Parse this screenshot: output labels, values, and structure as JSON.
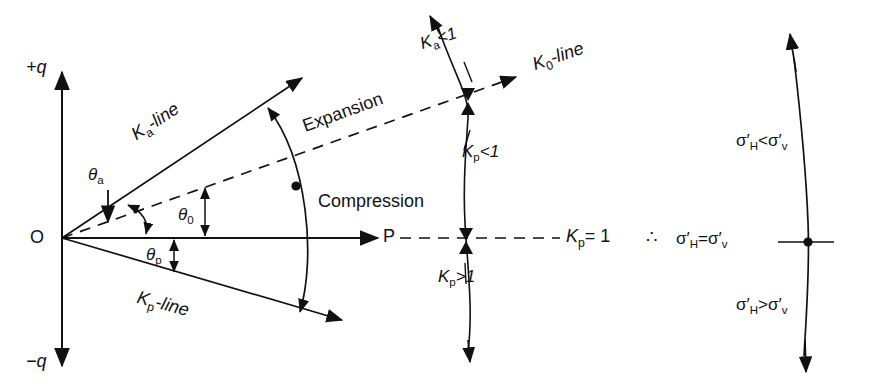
{
  "diagram": {
    "axes": {
      "positive_q": "+q",
      "negative_q": "−q",
      "origin": "O",
      "point_p": "P"
    },
    "lines": {
      "ka_line": "K",
      "ka_line_sub": "a",
      "ka_line_suffix": "-line",
      "k0_line": "K",
      "k0_line_sub": "0",
      "k0_line_suffix": "-line",
      "kp_line": "K",
      "kp_line_sub": "p",
      "kp_line_suffix": "-line"
    },
    "angles": {
      "theta_a": "θ",
      "theta_a_sub": "a",
      "theta_0": "θ",
      "theta_0_sub": "0",
      "theta_p": "θ",
      "theta_p_sub": "p"
    },
    "arc_labels": {
      "expansion": "Expansion",
      "compression": "Compression"
    },
    "k_values": {
      "ka_lt_1": "K",
      "ka_lt_1_sub": "a",
      "ka_lt_1_rel": "<1",
      "kp_lt_1": "K",
      "kp_lt_1_sub": "p",
      "kp_lt_1_rel": "<1",
      "kp_gt_1": "K",
      "kp_gt_1_sub": "p",
      "kp_gt_1_rel": ">1",
      "kp_eq_1": "K",
      "kp_eq_1_sub": "p",
      "kp_eq_1_rel": "= 1"
    },
    "therefore_symbol": "∴",
    "stress": {
      "sigma": "σ",
      "prime": "′",
      "sub_h": "H",
      "sub_v": "v",
      "lt": "<",
      "eq": "=",
      "gt": ">"
    },
    "colors": {
      "stroke": "#111111",
      "background": "#ffffff"
    }
  }
}
